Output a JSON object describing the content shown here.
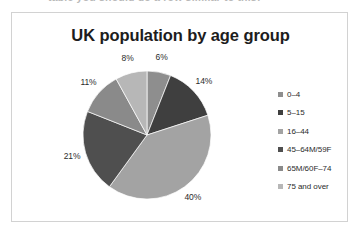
{
  "cutoff_line": "table you should do a row similar to this:",
  "chart": {
    "title": "UK population by age group",
    "frame_border_color": "#d2d2d2"
  },
  "legend": {
    "position": "right",
    "items": [
      {
        "label": "0–4",
        "color": "#8e8e8e"
      },
      {
        "label": "5–15",
        "color": "#3f3f3f"
      },
      {
        "label": "16–44",
        "color": "#a3a3a3"
      },
      {
        "label": "45–64M/59F",
        "color": "#4f4f4f"
      },
      {
        "label": "65M/60F–74",
        "color": "#8a8a8a"
      },
      {
        "label": "75 and over",
        "color": "#b7b7b7"
      }
    ]
  },
  "chart_data": {
    "type": "pie",
    "title": "UK population by age group",
    "xlabel": "",
    "ylabel": "",
    "legend_position": "right",
    "grid": false,
    "start_angle_deg": 0,
    "direction": "clockwise",
    "categories": [
      "0–4",
      "5–15",
      "16–44",
      "45–64M/59F",
      "65M/60F–74",
      "75 and over"
    ],
    "values": [
      6,
      14,
      40,
      21,
      11,
      8
    ],
    "value_unit": "percent",
    "data_labels": [
      "6%",
      "14%",
      "40%",
      "21%",
      "11%",
      "8%"
    ],
    "colors": [
      "#8e8e8e",
      "#3f3f3f",
      "#a3a3a3",
      "#4f4f4f",
      "#8a8a8a",
      "#b7b7b7"
    ]
  }
}
